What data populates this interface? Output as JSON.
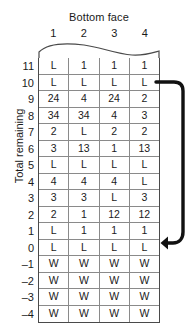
{
  "diagram": {
    "column_axis_title": "Bottom face",
    "row_axis_title": "Total remaining",
    "column_headers": [
      "1",
      "2",
      "3",
      "4"
    ],
    "row_labels": [
      "11",
      "10",
      "9",
      "8",
      "7",
      "6",
      "5",
      "4",
      "3",
      "2",
      "1",
      "0",
      "–1",
      "–2",
      "–3",
      "–4"
    ],
    "annotation": {
      "arrow_name": "loop-arrow-down",
      "arrow_description": "curved arrow running down the right side from row 10 to row 0"
    },
    "top_edge": {
      "style": "wavy-torn-edge",
      "meaning": "table continues above"
    },
    "colors": {
      "grid_line": "#8a8a8a",
      "outer_border": "#4a4a4a",
      "text": "#1a1a1a",
      "arrow": "#111111",
      "background": "#ffffff"
    },
    "rows": [
      {
        "label": "11",
        "cells": [
          "L",
          "1",
          "1",
          "1"
        ]
      },
      {
        "label": "10",
        "cells": [
          "L",
          "L",
          "L",
          "L"
        ]
      },
      {
        "label": "9",
        "cells": [
          "24",
          "4",
          "24",
          "2"
        ]
      },
      {
        "label": "8",
        "cells": [
          "34",
          "34",
          "4",
          "3"
        ]
      },
      {
        "label": "7",
        "cells": [
          "2",
          "L",
          "2",
          "2"
        ]
      },
      {
        "label": "6",
        "cells": [
          "3",
          "13",
          "1",
          "13"
        ]
      },
      {
        "label": "5",
        "cells": [
          "L",
          "L",
          "L",
          "L"
        ]
      },
      {
        "label": "4",
        "cells": [
          "4",
          "4",
          "4",
          "L"
        ]
      },
      {
        "label": "3",
        "cells": [
          "3",
          "3",
          "L",
          "3"
        ]
      },
      {
        "label": "2",
        "cells": [
          "2",
          "1",
          "12",
          "12"
        ]
      },
      {
        "label": "1",
        "cells": [
          "L",
          "1",
          "1",
          "1"
        ]
      },
      {
        "label": "0",
        "cells": [
          "L",
          "L",
          "L",
          "L"
        ]
      },
      {
        "label": "–1",
        "cells": [
          "W",
          "W",
          "W",
          "W"
        ]
      },
      {
        "label": "–2",
        "cells": [
          "W",
          "W",
          "W",
          "W"
        ]
      },
      {
        "label": "–3",
        "cells": [
          "W",
          "W",
          "W",
          "W"
        ]
      },
      {
        "label": "–4",
        "cells": [
          "W",
          "W",
          "W",
          "W"
        ]
      }
    ]
  }
}
